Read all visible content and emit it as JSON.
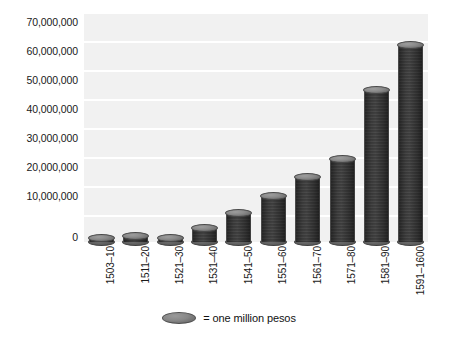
{
  "chart_data": {
    "type": "bar",
    "title": "",
    "subtitle": "",
    "xlabel": "",
    "ylabel": "",
    "categories": [
      "1503–10",
      "1511–20",
      "1521–30",
      "1531–40",
      "1541–50",
      "1551–60",
      "1561–70",
      "1571–80",
      "1581–90",
      "1591–1600"
    ],
    "values": [
      1500000,
      2000000,
      1500000,
      5000000,
      10000000,
      16000000,
      22500000,
      28500000,
      52500000,
      68000000
    ],
    "ylim": [
      0,
      70000000
    ],
    "y_ticks": [
      0,
      10000000,
      20000000,
      30000000,
      40000000,
      50000000,
      60000000,
      70000000
    ],
    "y_tick_labels": [
      "0",
      "10,000,000",
      "20,000,000",
      "30,000,000",
      "40,000,000",
      "50,000,000",
      "60,000,000",
      "70,000,000"
    ],
    "grid": true,
    "legend_position": "bottom",
    "legend": [
      {
        "marker": "coin-icon",
        "label": "= one million pesos"
      }
    ],
    "unit_value": 1000000,
    "plot_background": "#f1f1f1",
    "gridline_color": "#ffffff",
    "bar_color": "#7a7a7a",
    "text_color": "#1a1a1a"
  },
  "legend": {
    "coin_label": "coin-icon",
    "text": "= one million pesos"
  }
}
